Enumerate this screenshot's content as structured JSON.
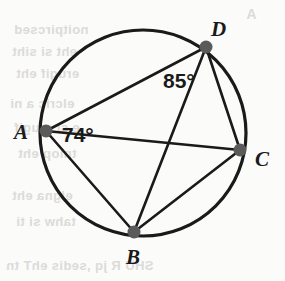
{
  "figure": {
    "type": "circle-inscribed-quadrilateral",
    "colors": {
      "stroke": "#1a1a1a",
      "vertex_fill": "#5a5a5a",
      "background": "#fbfbfa",
      "ghost_text": "#d8d6d2"
    },
    "circle": {
      "cx": 143,
      "cy": 133,
      "r": 103,
      "stroke_width": 3.2
    },
    "vertices": [
      {
        "id": "A",
        "label": "A",
        "x": 46,
        "y": 131,
        "r": 6.5,
        "label_x": 14,
        "label_y": 139
      },
      {
        "id": "B",
        "label": "B",
        "x": 134,
        "y": 232,
        "r": 6.5,
        "label_x": 126,
        "label_y": 264
      },
      {
        "id": "C",
        "label": "C",
        "x": 240,
        "y": 150,
        "r": 6.5,
        "label_x": 255,
        "label_y": 166
      },
      {
        "id": "D",
        "label": "D",
        "x": 206,
        "y": 47,
        "r": 6.5,
        "label_x": 211,
        "label_y": 36
      }
    ],
    "chords": [
      {
        "id": "AD",
        "from": "A",
        "to": "D",
        "x1": 46,
        "y1": 131,
        "x2": 206,
        "y2": 47
      },
      {
        "id": "AB",
        "from": "A",
        "to": "B",
        "x1": 46,
        "y1": 131,
        "x2": 134,
        "y2": 232
      },
      {
        "id": "AC",
        "from": "A",
        "to": "C",
        "x1": 46,
        "y1": 131,
        "x2": 240,
        "y2": 150
      },
      {
        "id": "DC",
        "from": "D",
        "to": "C",
        "x1": 206,
        "y1": 47,
        "x2": 240,
        "y2": 150
      },
      {
        "id": "BC",
        "from": "B",
        "to": "C",
        "x1": 134,
        "y1": 232,
        "x2": 240,
        "y2": 150
      },
      {
        "id": "BD",
        "from": "B",
        "to": "D",
        "x1": 134,
        "y1": 232,
        "x2": 206,
        "y2": 47
      }
    ],
    "angle_labels": [
      {
        "id": "angle-at-A",
        "text": "74°",
        "value": 74,
        "unit": "degrees",
        "at_vertex": "A",
        "x": 62,
        "y": 142
      },
      {
        "id": "angle-at-D",
        "text": "85°",
        "value": 85,
        "unit": "degrees",
        "at_vertex": "D",
        "x": 163,
        "y": 88
      }
    ],
    "ghost_text_lines": [
      {
        "text": "A",
        "x": 246,
        "y": 6,
        "size": 14
      },
      {
        "text": "noitpircsed",
        "x": 14,
        "y": 22,
        "size": 13
      },
      {
        "text": "eht si siht",
        "x": 12,
        "y": 44,
        "size": 13
      },
      {
        "text": "erugif eht",
        "x": 16,
        "y": 66,
        "size": 13
      },
      {
        "text": "elcric a ni",
        "x": 10,
        "y": 96,
        "size": 13
      },
      {
        "text": "e si erugif",
        "x": 14,
        "y": 120,
        "size": 13
      },
      {
        "text": "tniop eht",
        "x": 18,
        "y": 146,
        "size": 13
      },
      {
        "text": "elgna eht",
        "x": 12,
        "y": 188,
        "size": 13
      },
      {
        "text": "tahw si ti",
        "x": 16,
        "y": 214,
        "size": 13
      },
      {
        "text": "SHU R jq ,sedis ehT tn",
        "x": 6,
        "y": 258,
        "size": 13
      }
    ]
  }
}
